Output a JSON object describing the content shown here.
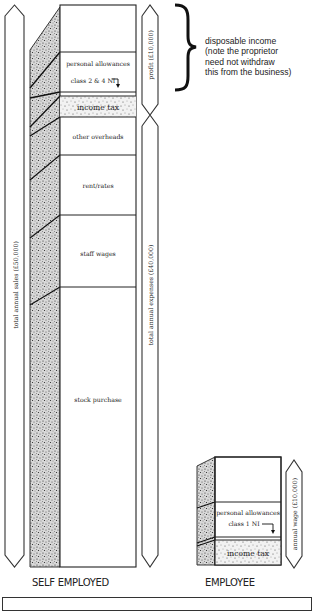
{
  "diagram": {
    "self_employed": {
      "caption": "SELF EMPLOYED",
      "sales_arrow_label": "total annual sales (£50,000)",
      "profit_arrow_label": "profit (£10,000)",
      "expenses_arrow_label": "total annual expenses (£40,000)",
      "segments": [
        {
          "label": "",
          "fill": "white"
        },
        {
          "label": "personal allowances",
          "sub_label": "class 2 & 4 NI",
          "fill": "white"
        },
        {
          "label": "income tax",
          "fill": "stipple"
        },
        {
          "label": "other overheads",
          "fill": "white"
        },
        {
          "label": "rent/rates",
          "fill": "white"
        },
        {
          "label": "staff wages",
          "fill": "white"
        },
        {
          "label": "stock purchase",
          "fill": "white"
        }
      ]
    },
    "employee": {
      "caption": "EMPLOYEE",
      "wage_arrow_label": "annual wage (£10,000)",
      "segments": [
        {
          "label": "",
          "fill": "white"
        },
        {
          "label": "personal allowances",
          "sub_label": "class 1 NI",
          "fill": "white"
        },
        {
          "label": "income tax",
          "fill": "stipple"
        }
      ]
    },
    "annotation": {
      "brace_note": "disposable income (note the proprietor need not withdraw this from the business)",
      "lines": [
        "disposable income",
        "(note the proprietor",
        "need not withdraw",
        "this from the business)"
      ]
    },
    "icons": {
      "brace": "curly-brace-icon",
      "ni_arrow": "down-arrow-icon"
    }
  }
}
